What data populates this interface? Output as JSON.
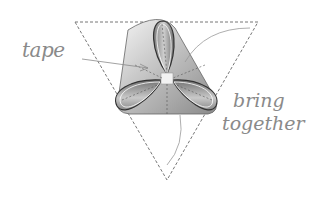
{
  "diagram": {
    "labels": {
      "tape": "tape",
      "bring": "bring",
      "together": "together"
    },
    "colors": {
      "line": "#8a8a8a",
      "dashed": "#777777",
      "fill_light": "#e6e6e6",
      "fill_dark": "#8c8c8c"
    }
  }
}
